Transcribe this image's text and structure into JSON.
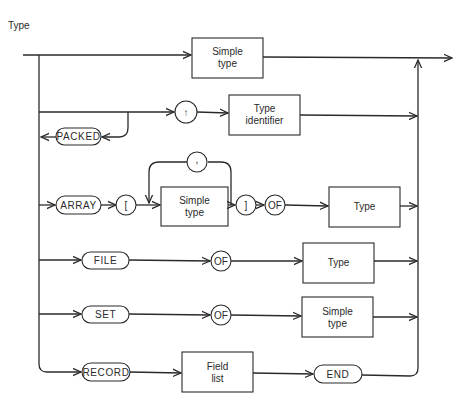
{
  "diagram": {
    "title": "Type",
    "kind": "syntax diagram",
    "rows": [
      {
        "id": "simple",
        "nodes": [
          {
            "type": "box",
            "label": [
              "Simple",
              "type"
            ]
          }
        ]
      },
      {
        "id": "pointer",
        "nodes": [
          {
            "type": "circle",
            "label": "↑"
          },
          {
            "type": "box",
            "label": [
              "Type",
              "identifier"
            ]
          }
        ]
      },
      {
        "id": "packed",
        "nodes": [
          {
            "type": "capsule",
            "label": "PACKED"
          }
        ]
      },
      {
        "id": "array",
        "nodes": [
          {
            "type": "capsule",
            "label": "ARRAY"
          },
          {
            "type": "circle",
            "label": "["
          },
          {
            "type": "box",
            "label": [
              "Simple",
              "type"
            ]
          },
          {
            "type": "circle",
            "label": ","
          },
          {
            "type": "circle",
            "label": "]"
          },
          {
            "type": "circle",
            "label": "OF"
          },
          {
            "type": "box",
            "label": [
              "Type"
            ]
          }
        ]
      },
      {
        "id": "file",
        "nodes": [
          {
            "type": "capsule",
            "label": "FILE"
          },
          {
            "type": "circle",
            "label": "OF"
          },
          {
            "type": "box",
            "label": [
              "Type"
            ]
          }
        ]
      },
      {
        "id": "set",
        "nodes": [
          {
            "type": "capsule",
            "label": "SET"
          },
          {
            "type": "circle",
            "label": "OF"
          },
          {
            "type": "box",
            "label": [
              "Simple",
              "type"
            ]
          }
        ]
      },
      {
        "id": "record",
        "nodes": [
          {
            "type": "capsule",
            "label": "RECORD"
          },
          {
            "type": "box",
            "label": [
              "Field",
              "list"
            ]
          },
          {
            "type": "capsule",
            "label": "END"
          }
        ]
      }
    ]
  },
  "labels": {
    "title": "Type",
    "simple_type_1": "Simple",
    "simple_type_2": "type",
    "pointer": "↑",
    "type_identifier_1": "Type",
    "type_identifier_2": "identifier",
    "packed": "PACKED",
    "array": "ARRAY",
    "lbracket": "[",
    "comma": ",",
    "rbracket": "]",
    "of": "OF",
    "type": "Type",
    "file": "FILE",
    "set": "SET",
    "record": "RECORD",
    "field_list_1": "Field",
    "field_list_2": "list",
    "end": "END"
  },
  "colors": {
    "line": "#2a2a2a",
    "background": "#ffffff"
  }
}
